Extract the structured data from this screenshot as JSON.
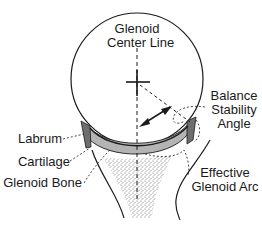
{
  "labels": {
    "glenoid_center_line": [
      "Glenoid",
      "Center Line"
    ],
    "balance_stability_angle": [
      "Balance",
      "Stability",
      "Angle"
    ],
    "labrum": "Labrum",
    "cartilage": "Cartilage",
    "glenoid_bone": "Glenoid Bone",
    "effective_glenoid_arc": [
      "Effective",
      "Glenoid Arc"
    ]
  },
  "colors": {
    "stroke": "#1a1a1a",
    "labrum_fill": "#6e6e6e",
    "cartilage_fill": "#b4b4b4",
    "bone_stipple": "#777777",
    "background": "#ffffff"
  }
}
